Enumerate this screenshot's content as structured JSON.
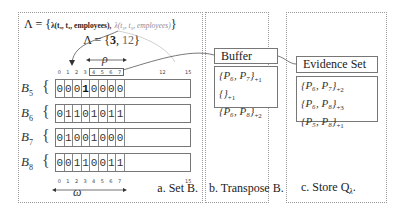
{
  "panel_a": {
    "lambda_set": {
      "prefix": "Λ = {",
      "item1": "λ(t₉, t₃, employees),",
      "item2": "λ(t₃, t₉, employees)",
      "suffix": "}"
    },
    "lambda_values": {
      "prefix": "Λ = {",
      "highlighted": "3",
      "sep": ", ",
      "other": "12",
      "suffix": "}"
    },
    "top_ticks": [
      "0",
      "1",
      "2",
      "3",
      "4",
      "5",
      "6",
      "7",
      "12",
      "15"
    ],
    "bottom_ticks": [
      "0",
      "1",
      "2",
      "3",
      "4",
      "5",
      "6",
      "7",
      "15"
    ],
    "rho_symbol": "ρ",
    "omega_symbol": "ω",
    "rows": [
      {
        "name": "B",
        "sub": "5",
        "bits": [
          "0",
          "0",
          "0",
          "1",
          "0",
          "0",
          "0",
          "0"
        ],
        "bold_index": 3
      },
      {
        "name": "B",
        "sub": "6",
        "bits": [
          "0",
          "1",
          "1",
          "0",
          "1",
          "0",
          "1",
          "1"
        ],
        "bold_index": -1
      },
      {
        "name": "B",
        "sub": "7",
        "bits": [
          "0",
          "1",
          "0",
          "0",
          "1",
          "0",
          "0",
          "0"
        ],
        "bold_index": -1
      },
      {
        "name": "B",
        "sub": "8",
        "bits": [
          "0",
          "0",
          "1",
          "1",
          "0",
          "0",
          "1",
          "1"
        ],
        "bold_index": -1
      }
    ],
    "caption": "a. Set B."
  },
  "panel_b": {
    "box_title": "Buffer",
    "entries": [
      {
        "set": "{P₆, P₇}",
        "count": "+1"
      },
      {
        "set": "{}",
        "count": "+1"
      },
      {
        "set": "{P₆, P₈}",
        "count": "+2"
      }
    ],
    "caption": "b. Transpose B."
  },
  "panel_c": {
    "box_title": "Evidence Set",
    "entries": [
      {
        "set": "{P₆, P₇}",
        "count": "+2"
      },
      {
        "set": "{P₆, P₈}",
        "count": "+3"
      },
      {
        "set": "{P₅, P₈}",
        "count": "+1"
      }
    ],
    "caption": "c. Store Q",
    "caption_sub": "λ",
    "caption_end": "."
  }
}
